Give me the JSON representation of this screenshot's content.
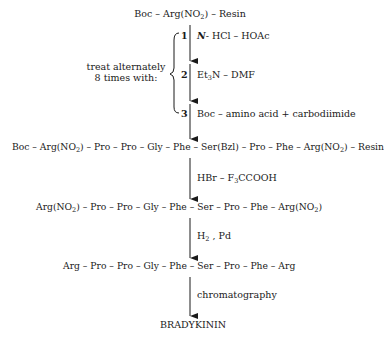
{
  "diagram": {
    "start": {
      "pre": "Boc – Arg(NO",
      "sub": "2",
      "post": ") – Resin"
    },
    "cycle_note": {
      "line1": "treat alternately",
      "line2": "8 times with:"
    },
    "cycle_steps": [
      {
        "num": "1",
        "reagent_pre": "N",
        "reagent_post": "- HCl – HOAc"
      },
      {
        "num": "2",
        "reagent_pre": "Et",
        "reagent_sub": "3",
        "reagent_post": "N – DMF"
      },
      {
        "num": "3",
        "reagent": "Boc – amino acid + carbodiimide"
      }
    ],
    "protected_peptide": {
      "p1": "Boc – Arg(NO",
      "s1": "2",
      "p2": ") – Pro – Pro – Gly – Phe – Ser(Bzl) – Pro – Phe – Arg(NO",
      "s2": "2",
      "p3": ") – Resin"
    },
    "step_cleave": {
      "pre": "HBr – F",
      "sub": "3",
      "post": "CCOOH"
    },
    "cleaved_peptide": {
      "p1": "Arg(NO",
      "s1": "2",
      "p2": ") – Pro – Pro – Gly – Phe – Ser – Pro – Phe – Arg(NO",
      "s2": "2",
      "p3": ")"
    },
    "step_hydrogenate": {
      "pre": "H",
      "sub": "2",
      "post": " , Pd"
    },
    "free_peptide": "Arg – Pro – Pro – Gly – Phe – Ser – Pro – Phe – Arg",
    "step_purify": "chromatography",
    "product": "BRADYKININ"
  }
}
